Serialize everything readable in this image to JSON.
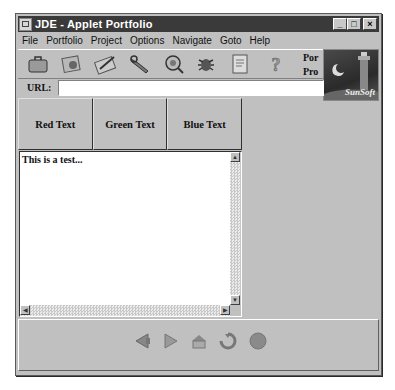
{
  "window": {
    "title": "JDE - Applet Portfolio",
    "buttons": {
      "minimize": "_",
      "maximize": "□",
      "close": "×"
    }
  },
  "menu": [
    "File",
    "Portfolio",
    "Project",
    "Options",
    "Navigate",
    "Goto",
    "Help"
  ],
  "toolbar": {
    "icons": [
      "briefcase-icon",
      "portfolio-icon",
      "project-edit-icon",
      "tools-icon",
      "inspect-icon",
      "debug-bug-icon",
      "document-icon",
      "help-icon"
    ],
    "side_labels": [
      "Por",
      "Pro"
    ]
  },
  "logo": {
    "text": "SunSoft"
  },
  "url": {
    "label": "URL:",
    "value": ""
  },
  "color_buttons": [
    "Red Text",
    "Green Text",
    "Blue Text"
  ],
  "textarea": {
    "content": "This is a test..."
  },
  "scrollbar": {
    "up": "▲",
    "down": "▼",
    "left": "◀",
    "right": "▶"
  },
  "navigation": {
    "icons": [
      "back-icon",
      "forward-icon",
      "home-icon",
      "refresh-icon",
      "stop-icon"
    ]
  }
}
